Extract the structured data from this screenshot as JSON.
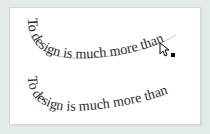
{
  "canvas": {
    "background": "#e3ebe8",
    "artboard_color": "#ffffff"
  },
  "type_on_path": [
    {
      "text": "To design is much more than",
      "path_visible": true
    },
    {
      "text": "To design is much more than",
      "path_visible": false
    }
  ],
  "cursor": {
    "icon": "path-selection-cursor-icon"
  }
}
